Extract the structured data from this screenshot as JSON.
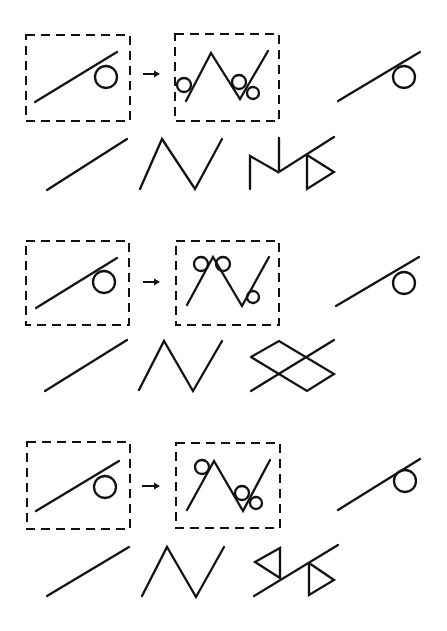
{
  "diagram": {
    "type": "visual-analogy",
    "colors": {
      "stroke": "#111111",
      "background": "#ffffff"
    },
    "panels": [
      {
        "name": "panel-1",
        "source_box": {
          "x": 26,
          "y": 35,
          "w": 104,
          "h": 86
        },
        "source_line": [
          [
            35,
            102
          ],
          [
            117,
            52
          ]
        ],
        "source_circle": {
          "cx": 106,
          "cy": 77,
          "r": 11
        },
        "arrow": {
          "x1": 143,
          "y1": 74,
          "x2": 160,
          "y2": 74
        },
        "target_box": {
          "x": 175,
          "y": 34,
          "w": 104,
          "h": 87
        },
        "target_polyline": [
          [
            186,
            101
          ],
          [
            211,
            53
          ],
          [
            240,
            99
          ],
          [
            268,
            51
          ]
        ],
        "target_circles": [
          {
            "cx": 184,
            "cy": 85,
            "r": 7
          },
          {
            "cx": 239,
            "cy": 82,
            "r": 7
          },
          {
            "cx": 253,
            "cy": 93,
            "r": 6
          }
        ],
        "query_line": [
          [
            338,
            101
          ],
          [
            420,
            52
          ]
        ],
        "query_circle": {
          "cx": 404,
          "cy": 77,
          "r": 11
        },
        "options": [
          {
            "label": "option-line",
            "polylines": [
              [
                [
                  47,
                  190
                ],
                [
                  127,
                  139
                ]
              ]
            ]
          },
          {
            "label": "option-zigzag",
            "polylines": [
              [
                [
                  140,
                  189
                ],
                [
                  162,
                  139
                ],
                [
                  195,
                  189
                ],
                [
                  222,
                  139
                ]
              ]
            ]
          },
          {
            "label": "option-m-triangle",
            "polylines": [
              [
                [
                  250,
                  189
                ],
                [
                  250,
                  156
                ],
                [
                  278,
                  172
                ]
              ],
              [
                [
                  279,
                  138
                ],
                [
                  279,
                  172
                ],
                [
                  334,
                  137
                ]
              ],
              [
                [
                  307,
                  155
                ],
                [
                  334,
                  172
                ],
                [
                  307,
                  189
                ],
                [
                  307,
                  155
                ]
              ]
            ]
          }
        ]
      },
      {
        "name": "panel-2",
        "source_box": {
          "x": 26,
          "y": 241,
          "w": 103,
          "h": 84
        },
        "source_line": [
          [
            36,
            308
          ],
          [
            117,
            258
          ]
        ],
        "source_circle": {
          "cx": 104,
          "cy": 282,
          "r": 11
        },
        "arrow": {
          "x1": 143,
          "y1": 282,
          "x2": 160,
          "y2": 282
        },
        "target_box": {
          "x": 176,
          "y": 241,
          "w": 103,
          "h": 84
        },
        "target_polyline": [
          [
            187,
            305
          ],
          [
            213,
            257
          ],
          [
            242,
            306
          ],
          [
            269,
            257
          ]
        ],
        "target_circles": [
          {
            "cx": 201,
            "cy": 264,
            "r": 7
          },
          {
            "cx": 223,
            "cy": 264,
            "r": 7
          },
          {
            "cx": 253,
            "cy": 297,
            "r": 6
          }
        ],
        "query_line": [
          [
            336,
            306
          ],
          [
            419,
            257
          ]
        ],
        "query_circle": {
          "cx": 404,
          "cy": 283,
          "r": 11
        },
        "options": [
          {
            "label": "option-line",
            "polylines": [
              [
                [
                  45,
                  391
                ],
                [
                  127,
                  340
                ]
              ]
            ]
          },
          {
            "label": "option-zigzag",
            "polylines": [
              [
                [
                  139,
                  390
                ],
                [
                  164,
                  341
                ],
                [
                  193,
                  391
                ],
                [
                  222,
                  341
                ]
              ]
            ]
          },
          {
            "label": "option-diamonds",
            "polylines": [
              [
                [
                  251,
                  391
                ],
                [
                  334,
                  340
                ]
              ],
              [
                [
                  251,
                  357
                ],
                [
                  279,
                  341
                ],
                [
                  334,
                  374
                ],
                [
                  307,
                  391
                ],
                [
                  251,
                  357
                ]
              ]
            ]
          }
        ]
      },
      {
        "name": "panel-3",
        "source_box": {
          "x": 27,
          "y": 442,
          "w": 103,
          "h": 87
        },
        "source_line": [
          [
            36,
            511
          ],
          [
            119,
            461
          ]
        ],
        "source_circle": {
          "cx": 105,
          "cy": 487,
          "r": 11
        },
        "arrow": {
          "x1": 142,
          "y1": 486,
          "x2": 160,
          "y2": 486
        },
        "target_box": {
          "x": 176,
          "y": 443,
          "w": 104,
          "h": 85
        },
        "target_polyline": [
          [
            187,
            510
          ],
          [
            214,
            461
          ],
          [
            243,
            511
          ],
          [
            270,
            460
          ]
        ],
        "target_circles": [
          {
            "cx": 202,
            "cy": 467,
            "r": 7
          },
          {
            "cx": 242,
            "cy": 493,
            "r": 7
          },
          {
            "cx": 256,
            "cy": 503,
            "r": 6
          }
        ],
        "query_line": [
          [
            338,
            510
          ],
          [
            420,
            459
          ]
        ],
        "query_circle": {
          "cx": 405,
          "cy": 481,
          "r": 11
        },
        "options": [
          {
            "label": "option-line",
            "polylines": [
              [
                [
                  47,
                  596
                ],
                [
                  129,
                  547
                ]
              ]
            ]
          },
          {
            "label": "option-zigzag",
            "polylines": [
              [
                [
                  142,
                  596
                ],
                [
                  167,
                  547
                ],
                [
                  196,
                  597
                ],
                [
                  224,
                  547
                ]
              ]
            ]
          },
          {
            "label": "option-double-triangle",
            "polylines": [
              [
                [
                  254,
                  596
                ],
                [
                  338,
                  545
                ]
              ],
              [
                [
                  280,
                  578
                ],
                [
                  280,
                  548
                ],
                [
                  255,
                  562
                ],
                [
                  280,
                  578
                ]
              ],
              [
                [
                  309,
                  563
                ],
                [
                  309,
                  595
                ],
                [
                  334,
                  580
                ],
                [
                  309,
                  563
                ]
              ]
            ]
          }
        ]
      }
    ]
  }
}
